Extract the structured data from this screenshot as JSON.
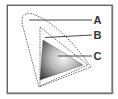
{
  "diagram": {
    "type": "color-gamut-comparison",
    "labels": {
      "a": "A",
      "b": "B",
      "c": "C"
    },
    "colors": {
      "frame": "#8a8a8a",
      "dotted_outline": "#555555",
      "leader_line": "#333333",
      "gradient_light": "#f4f4f4",
      "gradient_dark": "#3a3a3a"
    }
  }
}
